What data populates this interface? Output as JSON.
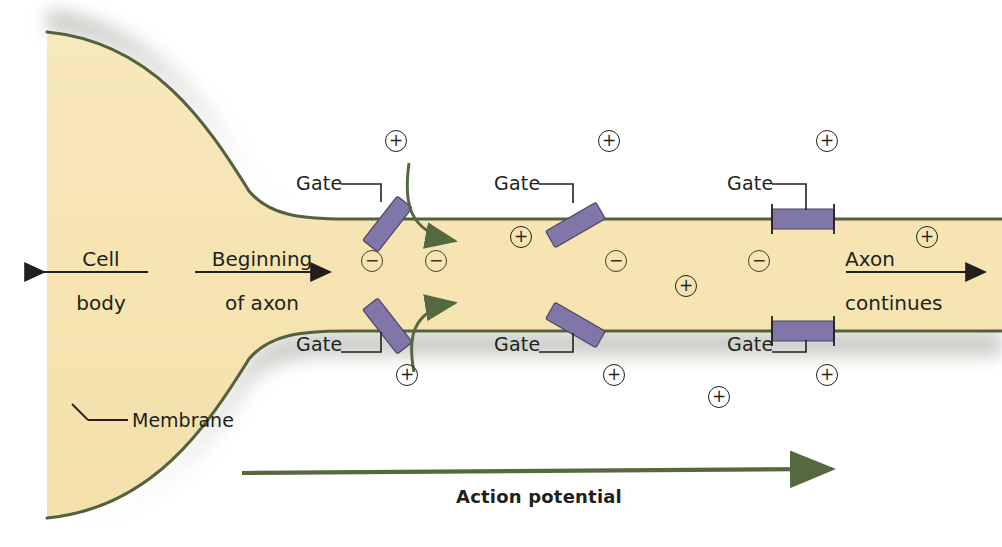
{
  "diagram": {
    "colors": {
      "cytoplasm": "#f6e5b4",
      "membrane_line": "#53613f",
      "gate": "#8076a8",
      "gate_stroke": "#4c4467",
      "arrow_green": "#56683f",
      "text": "#231f1c",
      "shadow": "#b9bdb2",
      "background": "#ffffff"
    },
    "labels": {
      "cell_body": {
        "line1": "Cell",
        "line2": "body"
      },
      "beginning_of_axon": {
        "line1": "Beginning",
        "line2": "of axon"
      },
      "axon_continues": {
        "line1": "Axon",
        "line2": "continues"
      },
      "membrane": "Membrane",
      "action_potential": "Action potential",
      "gate": "Gate"
    },
    "gate_labels": [
      {
        "text": "Gate",
        "x": 296,
        "y": 184,
        "side": "top",
        "state": "open"
      },
      {
        "text": "Gate",
        "x": 296,
        "y": 345,
        "side": "bottom",
        "state": "open"
      },
      {
        "text": "Gate",
        "x": 494,
        "y": 184,
        "side": "top",
        "state": "open"
      },
      {
        "text": "Gate",
        "x": 494,
        "y": 345,
        "side": "bottom",
        "state": "open"
      },
      {
        "text": "Gate",
        "x": 727,
        "y": 184,
        "side": "top",
        "state": "closed"
      },
      {
        "text": "Gate",
        "x": 727,
        "y": 345,
        "side": "bottom",
        "state": "closed"
      }
    ],
    "ions": {
      "positive_symbol": "+",
      "negative_symbol": "−",
      "outside_positive": [
        {
          "x": 396,
          "y": 141
        },
        {
          "x": 609,
          "y": 141
        },
        {
          "x": 827,
          "y": 141
        },
        {
          "x": 407,
          "y": 375
        },
        {
          "x": 614,
          "y": 375
        },
        {
          "x": 827,
          "y": 375
        },
        {
          "x": 719,
          "y": 397
        }
      ],
      "inside_positive": [
        {
          "x": 521,
          "y": 237
        },
        {
          "x": 686,
          "y": 286
        },
        {
          "x": 927,
          "y": 237
        }
      ],
      "inside_negative": [
        {
          "x": 372,
          "y": 261
        },
        {
          "x": 436,
          "y": 261
        },
        {
          "x": 616,
          "y": 261
        },
        {
          "x": 759,
          "y": 261
        }
      ]
    },
    "ion_influx_arrows": 2,
    "direction_arrows": [
      {
        "name": "cell-body-arrow",
        "direction": "left"
      },
      {
        "name": "beginning-of-axon-arrow",
        "direction": "right"
      },
      {
        "name": "axon-continues-arrow",
        "direction": "right"
      },
      {
        "name": "action-potential-arrow",
        "direction": "right"
      }
    ]
  }
}
